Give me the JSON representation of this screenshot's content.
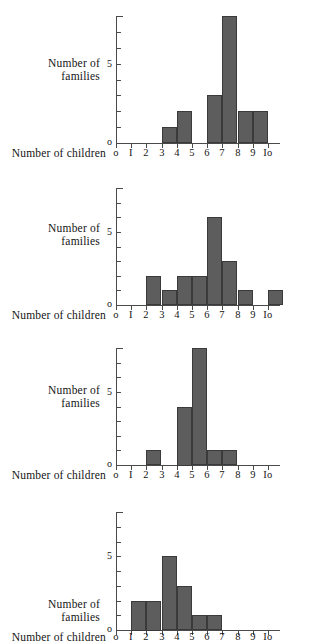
{
  "figure": {
    "axis_labels": {
      "y_line1": "Number of",
      "y_line2": "families",
      "x": "Number of children"
    },
    "y_tick_labels": {
      "zero": "o",
      "five": "5"
    },
    "x_tick_labels": [
      "o",
      "I",
      "2",
      "3",
      "4",
      "5",
      "6",
      "7",
      "8",
      "9",
      "Io"
    ],
    "colors": {
      "bar_fill": "#5d5d5d",
      "bar_stroke": "#3a3a3a",
      "axis": "#4a4a4a",
      "text": "#141414",
      "background": "#ffffff"
    }
  },
  "chart_data": [
    {
      "type": "bar",
      "title": "",
      "xlabel": "Number of children",
      "ylabel": "Number of families",
      "categories": [
        "0",
        "1",
        "2",
        "3",
        "4",
        "5",
        "6",
        "7",
        "8",
        "9",
        "10"
      ],
      "values": [
        0,
        0,
        0,
        1,
        2,
        0,
        3,
        8,
        2,
        2,
        0
      ],
      "xlim": [
        0,
        10
      ],
      "ylim": [
        0,
        8
      ],
      "yticks": [
        0,
        1,
        2,
        3,
        4,
        5,
        6,
        7,
        8
      ],
      "ytick_labels_shown": [
        "0",
        "5"
      ],
      "grid": false,
      "legend": "none",
      "note": "bars occupy the bin between tick n and tick n+1"
    },
    {
      "type": "bar",
      "title": "",
      "xlabel": "Number of children",
      "ylabel": "Number of families",
      "categories": [
        "0",
        "1",
        "2",
        "3",
        "4",
        "5",
        "6",
        "7",
        "8",
        "9",
        "10"
      ],
      "values": [
        0,
        0,
        2,
        1,
        2,
        2,
        6,
        3,
        1,
        0,
        1
      ],
      "xlim": [
        0,
        10
      ],
      "ylim": [
        0,
        8
      ],
      "yticks": [
        0,
        1,
        2,
        3,
        4,
        5,
        6,
        7,
        8
      ],
      "ytick_labels_shown": [
        "0",
        "5"
      ],
      "grid": false,
      "legend": "none"
    },
    {
      "type": "bar",
      "title": "",
      "xlabel": "Number of children",
      "ylabel": "Number of families",
      "categories": [
        "0",
        "1",
        "2",
        "3",
        "4",
        "5",
        "6",
        "7",
        "8",
        "9",
        "10"
      ],
      "values": [
        0,
        0,
        1,
        0,
        4,
        8,
        1,
        1,
        0,
        0,
        0
      ],
      "xlim": [
        0,
        10
      ],
      "ylim": [
        0,
        8
      ],
      "yticks": [
        0,
        1,
        2,
        3,
        4,
        5,
        6,
        7,
        8
      ],
      "ytick_labels_shown": [
        "0",
        "5"
      ],
      "grid": false,
      "legend": "none"
    },
    {
      "type": "bar",
      "title": "",
      "xlabel": "Number of children",
      "ylabel": "Number of families",
      "categories": [
        "0",
        "1",
        "2",
        "3",
        "4",
        "5",
        "6",
        "7",
        "8",
        "9",
        "10"
      ],
      "values": [
        0,
        2,
        2,
        5,
        3,
        1,
        1,
        0,
        0,
        0,
        0
      ],
      "xlim": [
        0,
        10
      ],
      "ylim": [
        0,
        8
      ],
      "yticks": [
        0,
        1,
        2,
        3,
        4,
        5,
        6,
        7,
        8
      ],
      "ytick_labels_shown": [
        "0",
        "5"
      ],
      "grid": false,
      "legend": "none"
    }
  ]
}
